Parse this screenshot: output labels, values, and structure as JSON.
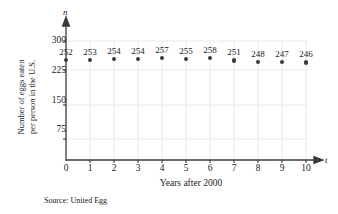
{
  "chart_data": {
    "type": "scatter",
    "title": "",
    "xlabel": "Years after 2000",
    "ylabel": "Number of eggs eaten per person in the U.S.",
    "ylabel_lines": [
      "Number of eggs eaten",
      "per person in the U.S."
    ],
    "x_axis_variable": "n",
    "y_axis_variable": "t",
    "x": [
      0,
      1,
      2,
      3,
      4,
      5,
      6,
      7,
      8,
      9,
      10
    ],
    "values": [
      252,
      253,
      254,
      254,
      257,
      255,
      258,
      251,
      248,
      247,
      246
    ],
    "point_labels": [
      "252",
      "253",
      "254",
      "254",
      "257",
      "255",
      "258",
      "251",
      "248",
      "247",
      "246"
    ],
    "xlim": [
      0,
      10
    ],
    "ylim": [
      0,
      300
    ],
    "xticks": [
      0,
      1,
      2,
      3,
      4,
      5,
      6,
      7,
      8,
      9,
      10
    ],
    "xtick_labels": [
      "0",
      "1",
      "2",
      "3",
      "4",
      "5",
      "6",
      "7",
      "8",
      "9",
      "10"
    ],
    "yticks": [
      75,
      150,
      225,
      300
    ],
    "ytick_labels": [
      "75",
      "150",
      "225",
      "300"
    ],
    "grid": true,
    "legend": "none",
    "source_note": "Source: United Egg",
    "marker_color": "#3a3a3a",
    "grid_color": "#e2e2e2",
    "axis_color": "#3a3a3a"
  },
  "axis_labels": {
    "vertical_variable": "n",
    "horizontal_variable": "t"
  }
}
